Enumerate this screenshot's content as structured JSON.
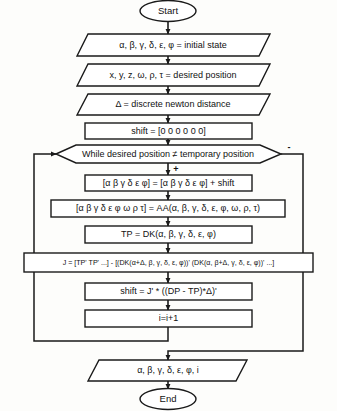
{
  "diagram": {
    "colors": {
      "stroke": "#1a1a1a",
      "fill": "#ffffff",
      "background": "#fdfdfb",
      "text": "#111111"
    },
    "nodes": {
      "start": {
        "label": "Start",
        "type": "terminal"
      },
      "initial_state": {
        "label": "α, β, γ, δ, ε, φ = initial state",
        "type": "input"
      },
      "desired_position": {
        "label": "x, y, z, ω, ρ, τ = desired position",
        "type": "input"
      },
      "newton_distance": {
        "label": "Δ = discrete newton distance",
        "type": "input"
      },
      "shift_init": {
        "label": "shift = [0 0 0 0 0 0]",
        "type": "process"
      },
      "while_condition": {
        "label": "While desired position ≠ temporary position",
        "type": "decision"
      },
      "angles_update": {
        "label": "[α β γ δ ε φ] = [α β γ δ ε φ] + shift",
        "type": "process"
      },
      "aa_call": {
        "label": "[α β γ δ ε φ ω ρ τ] = AA(α, β, γ, δ, ε, φ, ω, ρ, τ)",
        "type": "process"
      },
      "tp_call": {
        "label": "TP = DK(α, β, γ, δ, ε, φ)",
        "type": "process"
      },
      "jacobian": {
        "label": "J = [TP' TP' ...] - [(DK(α+Δ, β, γ, δ, ε, φ))' (DK(α, β+Δ, γ, δ, ε, φ))' ...]",
        "type": "process"
      },
      "shift_update": {
        "label": "shift = J' * ((DP - TP)*Δ)'",
        "type": "process"
      },
      "increment": {
        "label": "i=i+1",
        "type": "process"
      },
      "output": {
        "label": "α, β, γ, δ, ε, φ, i",
        "type": "output"
      },
      "end": {
        "label": "End",
        "type": "terminal"
      }
    },
    "branch_labels": {
      "true_branch": "+",
      "false_branch": "-"
    }
  }
}
